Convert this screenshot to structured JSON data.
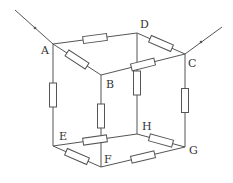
{
  "diagram": {
    "type": "resistor-cube-circuit",
    "line_color": "#555555",
    "vertices": {
      "A": {
        "x": 53,
        "y": 44
      },
      "B": {
        "x": 101,
        "y": 75
      },
      "C": {
        "x": 185,
        "y": 54
      },
      "D": {
        "x": 137,
        "y": 33
      },
      "E": {
        "x": 53,
        "y": 146
      },
      "F": {
        "x": 101,
        "y": 167
      },
      "G": {
        "x": 185,
        "y": 147
      },
      "H": {
        "x": 137,
        "y": 134
      }
    },
    "labels": {
      "A": "A",
      "B": "B",
      "C": "C",
      "D": "D",
      "E": "E",
      "F": "F",
      "G": "G",
      "H": "H"
    },
    "edges_with_resistors": [
      "AD",
      "AB",
      "DC",
      "BC",
      "AE",
      "BF",
      "DH",
      "CG",
      "EF",
      "EH",
      "FG",
      "HG"
    ],
    "terminals": [
      {
        "from": "external",
        "to": "A",
        "arrow": "in"
      },
      {
        "from": "external",
        "to": "C",
        "arrow": "in"
      }
    ]
  }
}
